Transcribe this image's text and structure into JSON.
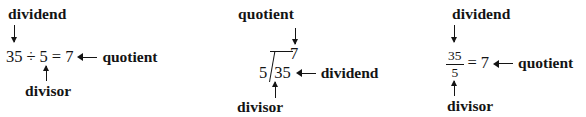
{
  "figure": {
    "background_color": "#ffffff",
    "text_color": "#141414"
  },
  "panels": [
    {
      "id": "inline",
      "name": "inline-division-expression",
      "top_label": "dividend",
      "bottom_label": "divisor",
      "right_label": "quotient",
      "expression": {
        "dividend": "35",
        "operator": "÷",
        "divisor": "5",
        "equals": "=",
        "quotient": "7"
      },
      "arrows": {
        "top": "down-arrow",
        "bottom": "up-arrow",
        "right": "left-arrow"
      }
    },
    {
      "id": "long",
      "name": "long-division-expression",
      "top_label": "quotient",
      "bottom_label": "divisor",
      "right_label": "dividend",
      "expression": {
        "dividend": "35",
        "divisor": "5",
        "quotient": "7",
        "bracket": "long-division-bracket"
      },
      "arrows": {
        "top": "down-arrow",
        "bottom": "up-arrow",
        "right": "left-arrow"
      }
    },
    {
      "id": "fraction",
      "name": "fraction-division-expression",
      "top_label": "dividend",
      "bottom_label": "divisor",
      "right_label": "quotient",
      "expression": {
        "dividend": "35",
        "divisor": "5",
        "equals": "=",
        "quotient": "7",
        "bar": "fraction-bar"
      },
      "arrows": {
        "top": "down-arrow",
        "bottom": "up-arrow",
        "right": "left-arrow"
      }
    }
  ]
}
